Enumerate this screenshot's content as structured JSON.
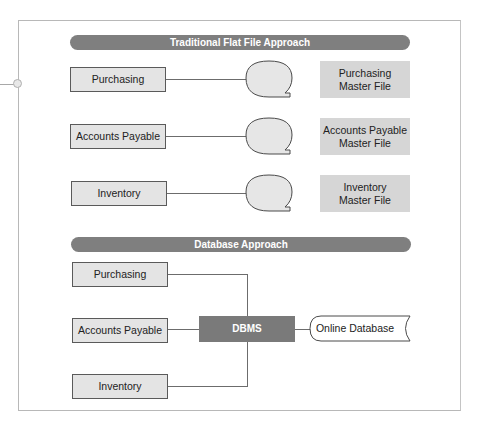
{
  "diagram": {
    "sections": [
      {
        "title": "Traditional Flat File Approach",
        "applications": [
          "Purchasing",
          "Accounts Payable",
          "Inventory"
        ],
        "master_files": [
          {
            "line1": "Purchasing",
            "line2": "Master File"
          },
          {
            "line1": "Accounts Payable",
            "line2": "Master File"
          },
          {
            "line1": "Inventory",
            "line2": "Master File"
          }
        ]
      },
      {
        "title": "Database Approach",
        "applications": [
          "Purchasing",
          "Accounts Payable",
          "Inventory"
        ],
        "dbms_label": "DBMS",
        "database_label": "Online Database"
      }
    ],
    "colors": {
      "banner": "#7f7f7f",
      "dbms": "#7a7a7a",
      "app_box": "#e4e4e4",
      "master_file": "#d6d6d6",
      "line": "#6c6c6c"
    }
  }
}
